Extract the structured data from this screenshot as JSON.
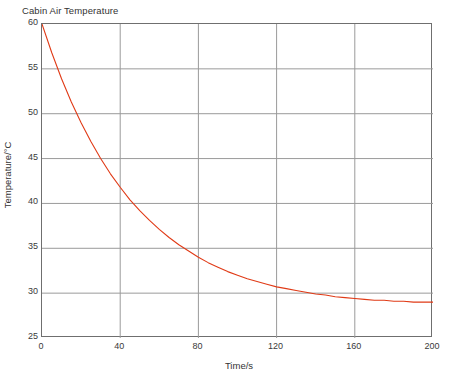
{
  "chart_data": {
    "type": "line",
    "title": "Cabin Air Temperature",
    "xlabel": "Time/s",
    "ylabel": "Temperature/°C",
    "xlim": [
      0,
      200
    ],
    "ylim": [
      25,
      60
    ],
    "xticks": [
      "0",
      "40",
      "80",
      "120",
      "160",
      "200"
    ],
    "xtick_values": [
      0,
      40,
      80,
      120,
      160,
      200
    ],
    "yticks": [
      "25",
      "30",
      "35",
      "40",
      "45",
      "50",
      "55",
      "60"
    ],
    "ytick_values": [
      25,
      30,
      35,
      40,
      45,
      50,
      55,
      60
    ],
    "grid": true,
    "legend": "none",
    "series": [
      {
        "name": "Cabin Air Temperature",
        "color": "#e03a16",
        "x": [
          0,
          5,
          10,
          15,
          20,
          25,
          30,
          35,
          40,
          45,
          50,
          55,
          60,
          65,
          70,
          75,
          80,
          85,
          90,
          95,
          100,
          105,
          110,
          115,
          120,
          125,
          130,
          135,
          140,
          145,
          150,
          155,
          160,
          165,
          170,
          175,
          180,
          185,
          190,
          195,
          200
        ],
        "values": [
          60.0,
          56.8,
          53.9,
          51.3,
          49.0,
          46.9,
          45.0,
          43.3,
          41.8,
          40.4,
          39.2,
          38.1,
          37.1,
          36.2,
          35.4,
          34.7,
          34.0,
          33.4,
          32.9,
          32.4,
          32.0,
          31.6,
          31.3,
          31.0,
          30.7,
          30.5,
          30.3,
          30.1,
          29.9,
          29.8,
          29.6,
          29.5,
          29.4,
          29.3,
          29.2,
          29.2,
          29.1,
          29.1,
          29.0,
          29.0,
          29.0
        ]
      }
    ]
  },
  "style": {
    "curve_color": "#e03a16",
    "grid_color": "#9a9a9a",
    "frame_color": "#6f6f6f",
    "text_color": "#333333",
    "background": "#ffffff"
  }
}
